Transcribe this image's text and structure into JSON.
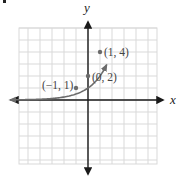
{
  "chart_data": {
    "type": "line",
    "title": "",
    "function": "y = 2^x",
    "xlabel": "x",
    "ylabel": "y",
    "xlim": [
      -6,
      6
    ],
    "ylim": [
      -5.5,
      6
    ],
    "grid": true,
    "grid_step": 1,
    "series": [
      {
        "name": "y = 2^x",
        "x": [
          -6,
          -5,
          -4,
          -3,
          -2,
          -1,
          0,
          1,
          1.5
        ],
        "y": [
          0.03125,
          0.0625,
          0.125,
          0.25,
          0.5,
          1,
          2,
          4,
          5.66
        ],
        "color": "#6b6b6b",
        "left_end": "arrow",
        "right_end": "arrow"
      }
    ],
    "labeled_points": [
      {
        "x": -1,
        "y": 1,
        "label": "(−1, 1)"
      },
      {
        "x": 0,
        "y": 2,
        "label": "(0, 2)"
      },
      {
        "x": 1,
        "y": 4,
        "label": "(1, 4)"
      }
    ],
    "annotations": [
      "(−1, 1)",
      "(0, 2)",
      "(1, 4)"
    ]
  },
  "axes": {
    "x_label": "x",
    "y_label": "y"
  },
  "points": [
    {
      "label": "(−1, 1)"
    },
    {
      "label": "(0, 2)"
    },
    {
      "label": "(1, 4)"
    }
  ],
  "colors": {
    "grid": "#d9d9d9",
    "axis": "#1a1a1a",
    "curve": "#6b6b6b",
    "point": "#6b6b6b",
    "label": "#444444"
  }
}
